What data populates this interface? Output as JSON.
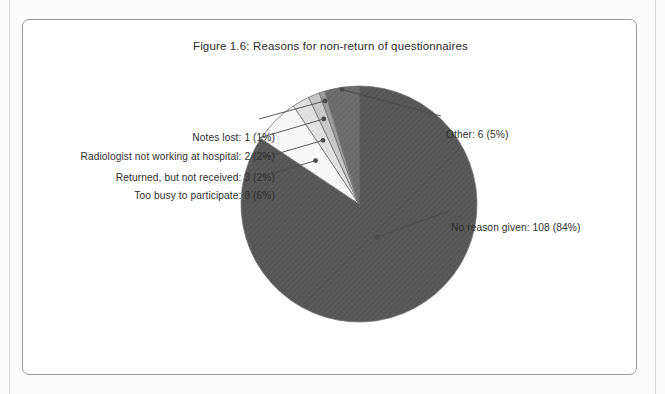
{
  "figure": {
    "title": "Figure 1.6: Reasons for non-return of questionnaires"
  },
  "colors": {
    "frame_border": "#9a9a9a",
    "slice_dark": "#5a5a5a",
    "slice_mid_dark": "#6e6e6e",
    "slice_mid": "#9e9e9e",
    "slice_light": "#c9c9c9",
    "slice_lighter": "#e2e2e2",
    "slice_white": "#f7f7f7",
    "leader_line": "#4a4a4a",
    "text": "#2f2f2f"
  },
  "chart_data": {
    "type": "pie",
    "title": "Figure 1.6: Reasons for non-return of questionnaires",
    "total": 128,
    "unit": "questionnaires",
    "legend": "none",
    "labels_position": "callout-leader-lines",
    "categories": [
      "No reason given",
      "Too busy to participate",
      "Returned, but not received",
      "Radiologist not working at hospital",
      "Notes lost",
      "Other"
    ],
    "values": [
      108,
      8,
      3,
      2,
      1,
      6
    ],
    "percentages": [
      84,
      6,
      2,
      2,
      1,
      5
    ],
    "slices": [
      {
        "name": "No reason given",
        "value": 108,
        "percent": 84,
        "label": "No reason given: 108 (84%)",
        "fill": "#5a5a5a",
        "side": "right"
      },
      {
        "name": "Too busy to participate",
        "value": 8,
        "percent": 6,
        "label": "Too busy to participate: 8 (6%)",
        "fill": "#f7f7f7",
        "side": "left"
      },
      {
        "name": "Returned, but not received",
        "value": 3,
        "percent": 2,
        "label": "Returned, but not received: 3 (2%)",
        "fill": "#e2e2e2",
        "side": "left"
      },
      {
        "name": "Radiologist not working at hospital",
        "value": 2,
        "percent": 2,
        "label": "Radiologist not working at hospital: 2 (2%)",
        "fill": "#c9c9c9",
        "side": "left"
      },
      {
        "name": "Notes lost",
        "value": 1,
        "percent": 1,
        "label": "Notes lost: 1 (1%)",
        "fill": "#9e9e9e",
        "side": "left"
      },
      {
        "name": "Other",
        "value": 6,
        "percent": 5,
        "label": "Other: 6 (5%)",
        "fill": "#6e6e6e",
        "side": "right"
      }
    ]
  }
}
